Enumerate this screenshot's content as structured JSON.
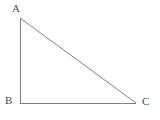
{
  "figure": {
    "kind": "geometry-diagram",
    "shape_name": "right triangle",
    "background_color": "#ffffff",
    "stroke_color": "#808080",
    "label_color": "#4a4a4a",
    "stroke_width": 1,
    "canvas": {
      "width": 160,
      "height": 120
    },
    "vertices": [
      {
        "id": "A",
        "label": "A",
        "x": 20,
        "y": 18,
        "label_x": 12,
        "label_y": 3,
        "role": "apex"
      },
      {
        "id": "B",
        "label": "B",
        "x": 20,
        "y": 103,
        "label_x": 5,
        "label_y": 95,
        "role": "right-angle"
      },
      {
        "id": "C",
        "label": "C",
        "x": 136,
        "y": 103,
        "label_x": 142,
        "label_y": 96,
        "role": "base-right"
      }
    ],
    "edges": [
      {
        "id": "AB",
        "from": "A",
        "to": "B",
        "name": "vertical-leg",
        "x1": 20,
        "y1": 18,
        "x2": 20,
        "y2": 103
      },
      {
        "id": "BC",
        "from": "B",
        "to": "C",
        "name": "horizontal-leg",
        "x1": 20,
        "y1": 103,
        "x2": 136,
        "y2": 103
      },
      {
        "id": "CA",
        "from": "C",
        "to": "A",
        "name": "hypotenuse",
        "x1": 136,
        "y1": 103,
        "x2": 20,
        "y2": 18
      }
    ]
  }
}
